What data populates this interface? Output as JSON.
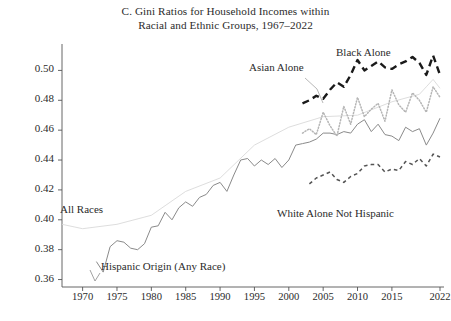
{
  "title": {
    "line1": "C. Gini Ratios for Household Incomes within",
    "line2": "Racial and Ethnic Groups, 1967–2022"
  },
  "annotations": {
    "all_races": "All Races",
    "hispanic": "Hispanic Origin (Any Race)",
    "asian": "Asian Alone",
    "black": "Black Alone",
    "white_nh": "White Alone Not Hispanic"
  },
  "colors": {
    "black_alone": "#1a1a1a",
    "hispanic": "#8a8a8a",
    "all_races": "#d9d9d9",
    "asian": "#b5b5b5",
    "white_nh": "#555555",
    "axis": "#555555",
    "text": "#2b2b2b"
  },
  "chart_data": {
    "type": "line",
    "title": "C. Gini Ratios for Household Incomes within Racial and Ethnic Groups, 1967–2022",
    "xlabel": "",
    "ylabel": "",
    "xlim": [
      1967,
      2022
    ],
    "ylim": [
      0.355,
      0.515
    ],
    "yticks": [
      0.36,
      0.38,
      0.4,
      0.42,
      0.44,
      0.46,
      0.48,
      0.5
    ],
    "ytick_labels": [
      "0.36",
      "0.38",
      "0.40",
      "0.42",
      "0.44",
      "0.46",
      "0.48",
      "0.50"
    ],
    "xticks": [
      1970,
      1975,
      1980,
      1985,
      1990,
      1995,
      2000,
      2005,
      2010,
      2015,
      2022
    ],
    "xtick_labels": [
      "1970",
      "1975",
      "1980",
      "1985",
      "1990",
      "1995",
      "2000",
      "2005",
      "2010",
      "2015",
      "2022"
    ],
    "grid": false,
    "legend_position": "inline-annotations",
    "series": [
      {
        "name": "Hispanic Origin (Any Race)",
        "style": "solid",
        "color": "#8a8a8a",
        "x": [
          1972,
          1973,
          1974,
          1975,
          1976,
          1977,
          1978,
          1979,
          1980,
          1981,
          1982,
          1983,
          1984,
          1985,
          1986,
          1987,
          1988,
          1989,
          1990,
          1991,
          1992,
          1993,
          1994,
          1995,
          1996,
          1997,
          1998,
          1999,
          2000,
          2001,
          2002,
          2003,
          2004,
          2005,
          2006,
          2007,
          2008,
          2009,
          2010,
          2011,
          2012,
          2013,
          2014,
          2015,
          2016,
          2017,
          2018,
          2019,
          2020,
          2021,
          2022
        ],
        "values": [
          0.372,
          0.365,
          0.382,
          0.386,
          0.385,
          0.381,
          0.38,
          0.384,
          0.395,
          0.396,
          0.405,
          0.4,
          0.408,
          0.412,
          0.409,
          0.415,
          0.417,
          0.423,
          0.425,
          0.419,
          0.43,
          0.44,
          0.441,
          0.436,
          0.44,
          0.437,
          0.441,
          0.435,
          0.44,
          0.45,
          0.451,
          0.452,
          0.454,
          0.458,
          0.458,
          0.457,
          0.459,
          0.458,
          0.464,
          0.467,
          0.459,
          0.464,
          0.457,
          0.456,
          0.453,
          0.462,
          0.459,
          0.461,
          0.45,
          0.458,
          0.468
        ]
      },
      {
        "name": "All Races",
        "style": "solid-faint",
        "color": "#d9d9d9",
        "x": [
          1967,
          1970,
          1975,
          1980,
          1985,
          1990,
          1995,
          2000,
          2005,
          2010,
          2015,
          2019,
          2020,
          2021,
          2022
        ],
        "values": [
          0.397,
          0.394,
          0.397,
          0.403,
          0.419,
          0.428,
          0.45,
          0.462,
          0.469,
          0.47,
          0.479,
          0.484,
          0.489,
          0.494,
          0.488
        ]
      },
      {
        "name": "Asian Alone",
        "style": "dotted",
        "color": "#b5b5b5",
        "x": [
          2002,
          2003,
          2004,
          2005,
          2006,
          2007,
          2008,
          2009,
          2010,
          2011,
          2012,
          2013,
          2014,
          2015,
          2016,
          2017,
          2018,
          2019,
          2020,
          2021,
          2022
        ],
        "values": [
          0.458,
          0.461,
          0.457,
          0.472,
          0.463,
          0.456,
          0.476,
          0.464,
          0.482,
          0.469,
          0.474,
          0.478,
          0.466,
          0.487,
          0.477,
          0.472,
          0.485,
          0.48,
          0.472,
          0.489,
          0.482
        ]
      },
      {
        "name": "Black Alone",
        "style": "dashed",
        "color": "#1a1a1a",
        "x": [
          2002,
          2003,
          2004,
          2005,
          2006,
          2007,
          2008,
          2009,
          2010,
          2011,
          2012,
          2013,
          2014,
          2015,
          2016,
          2017,
          2018,
          2019,
          2020,
          2021,
          2022
        ],
        "values": [
          0.478,
          0.48,
          0.483,
          0.481,
          0.487,
          0.492,
          0.489,
          0.497,
          0.507,
          0.5,
          0.503,
          0.506,
          0.502,
          0.501,
          0.504,
          0.506,
          0.509,
          0.505,
          0.497,
          0.51,
          0.497
        ]
      },
      {
        "name": "White Alone Not Hispanic",
        "style": "dashed-small",
        "color": "#555555",
        "x": [
          2003,
          2004,
          2005,
          2006,
          2007,
          2008,
          2009,
          2010,
          2011,
          2012,
          2013,
          2014,
          2015,
          2016,
          2017,
          2018,
          2019,
          2020,
          2021,
          2022
        ],
        "values": [
          0.424,
          0.428,
          0.43,
          0.432,
          0.427,
          0.425,
          0.429,
          0.431,
          0.436,
          0.437,
          0.437,
          0.432,
          0.434,
          0.433,
          0.439,
          0.437,
          0.441,
          0.436,
          0.444,
          0.442
        ]
      }
    ]
  }
}
